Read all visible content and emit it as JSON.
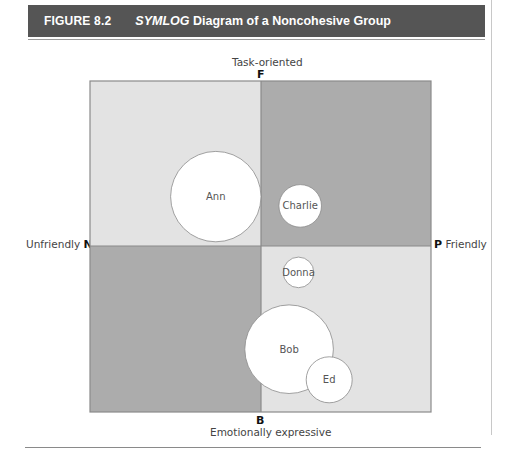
{
  "figure": {
    "number": "FIGURE 8.2",
    "title_italic": "SYMLOG",
    "title_rest": " Diagram of a Noncohesive Group"
  },
  "axes": {
    "top": {
      "letter": "F",
      "label": "Task-oriented"
    },
    "bottom": {
      "letter": "B",
      "label": "Emotionally expressive"
    },
    "left": {
      "letter": "N",
      "label": "Unfriendly"
    },
    "right": {
      "letter": "P",
      "label": "Friendly"
    }
  },
  "colors": {
    "light_quadrant": "#e3e3e3",
    "dark_quadrant": "#acacac",
    "border": "#8a8a8a",
    "circle_fill": "#ffffff",
    "header_bg": "#555555"
  },
  "quadrants": [
    {
      "name": "NF",
      "shade": "light"
    },
    {
      "name": "PF",
      "shade": "dark"
    },
    {
      "name": "NB",
      "shade": "dark"
    },
    {
      "name": "PB",
      "shade": "light"
    }
  ],
  "members": [
    {
      "name": "Ann",
      "x": -0.53,
      "y": 0.58,
      "size": 0.53
    },
    {
      "name": "Charlie",
      "x": 0.46,
      "y": 0.47,
      "size": 0.25
    },
    {
      "name": "Donna",
      "x": 0.44,
      "y": -0.31,
      "size": 0.18
    },
    {
      "name": "Bob",
      "x": 0.33,
      "y": -1.21,
      "size": 0.52
    },
    {
      "name": "Ed",
      "x": 0.8,
      "y": -1.57,
      "size": 0.27
    }
  ]
}
